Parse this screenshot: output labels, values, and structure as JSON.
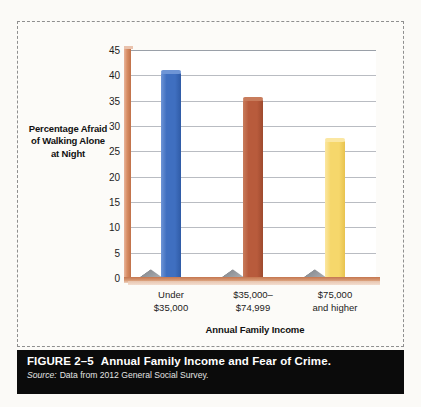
{
  "figure": {
    "number_label": "FIGURE 2–5",
    "title": "Annual Family Income and Fear of Crime.",
    "source_label": "Source:",
    "source_text": "Data from 2012 General Social Survey."
  },
  "colors": {
    "bar_blue": "#3F6FC0",
    "bar_blue_light": "#6E95D6",
    "bar_blue_dark": "#2F5BA6",
    "bar_red": "#B85B3C",
    "bar_red_light": "#C87C5C",
    "bar_red_dark": "#9E4A2E",
    "bar_yellow": "#F6D76B",
    "bar_yellow_light": "#FBE7A2",
    "bar_yellow_dark": "#E8C34F",
    "axis_terracotta": "#C0714A",
    "gridline": "#b9bcc2",
    "plot_background": "#ffffff",
    "page_background": "#fbfaf7",
    "caption_background": "#0b0b0b",
    "caption_text": "#ffffff"
  },
  "chart_data": {
    "type": "bar",
    "title": "Annual Family Income and Fear of Crime.",
    "xlabel": "Annual Family Income",
    "ylabel": "Percentage Afraid of Walking Alone at Night",
    "categories": [
      "Under\n$35,000",
      "$35,000–\n$74,999",
      "$75,000\nand higher"
    ],
    "values": [
      40.4,
      35.2,
      27.0
    ],
    "bar_colors": [
      "#3F6FC0",
      "#B85B3C",
      "#F6D76B"
    ],
    "ylim": [
      0,
      45
    ],
    "ytick_labels": [
      "0",
      "5",
      "10",
      "15",
      "20",
      "25",
      "30",
      "35",
      "40",
      "45"
    ],
    "ytick_values": [
      0,
      5,
      10,
      15,
      20,
      25,
      30,
      35,
      40,
      45
    ],
    "grid": true,
    "legend": false,
    "style": "3d-column"
  }
}
